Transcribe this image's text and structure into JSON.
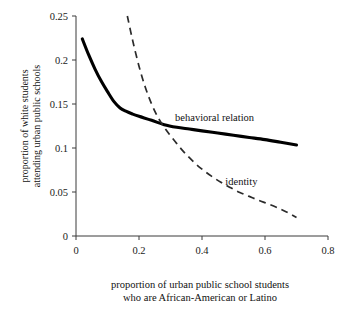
{
  "chart_data": {
    "type": "line",
    "title": "",
    "xlabel": "proportion of urban public school students",
    "xlabel_line2": "who are African-American or Latino",
    "ylabel": "proportion of white students",
    "ylabel_line2": "attending urban public schools",
    "xlim": [
      0,
      0.8
    ],
    "ylim": [
      0,
      0.25
    ],
    "xticks": [
      0,
      0.2,
      0.4,
      0.6,
      0.8
    ],
    "xtick_labels": [
      "0",
      "0.2",
      "0.4",
      "0.6",
      "0.8"
    ],
    "yticks": [
      0,
      0.05,
      0.1,
      0.15,
      0.2,
      0.25
    ],
    "ytick_labels": [
      "0",
      "0.05",
      "0.1",
      "0.15",
      "0.2",
      "0.25"
    ],
    "grid": false,
    "legend_position": "inline-annotations",
    "series": [
      {
        "name": "behavioral relation",
        "style": "solid",
        "color": "#000000",
        "label_x": 0.44,
        "label_y": 0.131,
        "points": [
          [
            0.02,
            0.224
          ],
          [
            0.04,
            0.206
          ],
          [
            0.06,
            0.19
          ],
          [
            0.08,
            0.176
          ],
          [
            0.1,
            0.164
          ],
          [
            0.12,
            0.153
          ],
          [
            0.14,
            0.1455
          ],
          [
            0.16,
            0.1415
          ],
          [
            0.18,
            0.1385
          ],
          [
            0.2,
            0.136
          ],
          [
            0.24,
            0.1315
          ],
          [
            0.28,
            0.1265
          ],
          [
            0.32,
            0.1235
          ],
          [
            0.36,
            0.1215
          ],
          [
            0.4,
            0.1195
          ],
          [
            0.45,
            0.117
          ],
          [
            0.5,
            0.1145
          ],
          [
            0.55,
            0.112
          ],
          [
            0.6,
            0.1095
          ],
          [
            0.65,
            0.1065
          ],
          [
            0.7,
            0.1035
          ]
        ]
      },
      {
        "name": "identity",
        "style": "dashed",
        "color": "#2b2b2b",
        "label_x": 0.525,
        "label_y": 0.0575,
        "points": [
          [
            0.163,
            0.25
          ],
          [
            0.18,
            0.222
          ],
          [
            0.2,
            0.193
          ],
          [
            0.22,
            0.169
          ],
          [
            0.24,
            0.15
          ],
          [
            0.26,
            0.135
          ],
          [
            0.28,
            0.1235
          ],
          [
            0.3,
            0.114
          ],
          [
            0.32,
            0.105
          ],
          [
            0.34,
            0.0965
          ],
          [
            0.36,
            0.089
          ],
          [
            0.38,
            0.082
          ],
          [
            0.4,
            0.076
          ],
          [
            0.43,
            0.068
          ],
          [
            0.46,
            0.061
          ],
          [
            0.49,
            0.055
          ],
          [
            0.52,
            0.0495
          ],
          [
            0.55,
            0.045
          ],
          [
            0.58,
            0.0405
          ],
          [
            0.61,
            0.0365
          ],
          [
            0.64,
            0.032
          ],
          [
            0.67,
            0.027
          ],
          [
            0.7,
            0.021
          ]
        ]
      }
    ]
  }
}
